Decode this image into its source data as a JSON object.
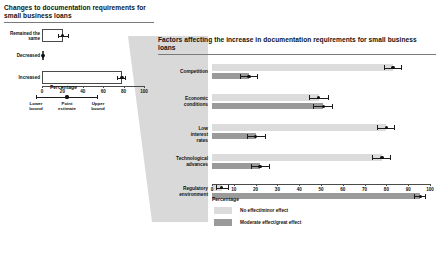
{
  "left_panel": {
    "title": "Changes to documentation requirements for small business loans",
    "axis_label": "Percentage",
    "key": {
      "lower_label": "Lower bound",
      "point_label": "Point estimate",
      "upper_label": "Upper bound"
    }
  },
  "right_panel": {
    "title": "Factors affecting the increase in documentation requirements for small business loans",
    "axis_label": "Percentage",
    "legend": [
      {
        "label": "No effect/minor effect",
        "color": "#dcdcdc"
      },
      {
        "label": "Moderate effect/great effect",
        "color": "#9a9a9a"
      }
    ]
  },
  "chart_data": [
    {
      "type": "bar",
      "id": "changes-to-documentation-requirements",
      "title": "Changes to documentation requirements for small business loans",
      "xlabel": "Percentage",
      "ylabel": "",
      "xlim": [
        0,
        100
      ],
      "xticks": [
        0,
        20,
        40,
        60,
        80,
        100
      ],
      "grid": false,
      "orientation": "horizontal",
      "error_bars": "95% confidence interval (lower bound / point estimate / upper bound)",
      "categories": [
        "Remained the same",
        "Decreased",
        "Increased"
      ],
      "values": [
        20.5,
        1.0,
        78.5
      ],
      "lower": [
        15.5,
        0.3,
        74.0
      ],
      "upper": [
        26.0,
        2.0,
        82.5
      ]
    },
    {
      "type": "bar",
      "id": "factors-affecting-increase",
      "title": "Factors affecting the increase in documentation requirements for small business loans",
      "xlabel": "Percentage",
      "ylabel": "",
      "xlim": [
        0,
        100
      ],
      "xticks": [
        0,
        10,
        20,
        30,
        40,
        50,
        60,
        70,
        80,
        90,
        100
      ],
      "grid": false,
      "orientation": "horizontal",
      "legend_position": "bottom-left",
      "error_bars": "95% confidence interval",
      "categories": [
        "Competition",
        "Economic conditions",
        "Low interest rates",
        "Technological advances",
        "Regulatory environment"
      ],
      "series": [
        {
          "name": "No effect/minor effect",
          "color": "#dcdcdc",
          "values": [
            83.0,
            49.0,
            80.0,
            78.0,
            4.5
          ],
          "lower": [
            79.0,
            44.5,
            75.5,
            73.5,
            2.0
          ],
          "upper": [
            87.0,
            53.5,
            84.0,
            82.0,
            7.5
          ]
        },
        {
          "name": "Moderate effect/great effect",
          "color": "#9a9a9a",
          "values": [
            17.0,
            51.0,
            20.0,
            22.0,
            95.5
          ],
          "lower": [
            13.0,
            46.5,
            16.0,
            18.0,
            92.5
          ],
          "upper": [
            21.0,
            55.5,
            24.5,
            26.5,
            98.0
          ]
        }
      ]
    }
  ]
}
